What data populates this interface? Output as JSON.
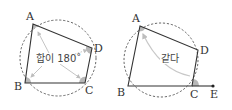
{
  "figures": [
    {
      "id": "left",
      "points": {
        "A": "A",
        "B": "B",
        "C": "C",
        "D": "D"
      },
      "annotation": "합이 180˚"
    },
    {
      "id": "right",
      "points": {
        "A": "A",
        "B": "B",
        "C": "C",
        "D": "D",
        "E": "E"
      },
      "annotation": "같다"
    }
  ],
  "colors": {
    "line": "#333333",
    "circle": "#555555",
    "angle_fill": "#b8b8b8",
    "arrow": "#bdbdbd"
  }
}
